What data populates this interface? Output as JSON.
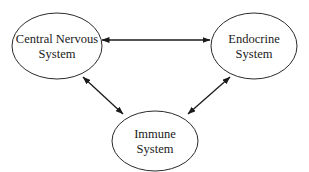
{
  "diagram": {
    "nodes": [
      {
        "id": "cns",
        "label_lines": [
          "Central Nervous",
          "System"
        ]
      },
      {
        "id": "endocrine",
        "label_lines": [
          "Endocrine",
          "System"
        ]
      },
      {
        "id": "immune",
        "label_lines": [
          "Immune",
          "System"
        ]
      }
    ],
    "edges": [
      {
        "from": "cns",
        "to": "endocrine",
        "direction": "bidirectional"
      },
      {
        "from": "cns",
        "to": "immune",
        "direction": "bidirectional"
      },
      {
        "from": "endocrine",
        "to": "immune",
        "direction": "bidirectional"
      }
    ],
    "colors": {
      "stroke": "#1a1a1a",
      "fill": "#ffffff"
    }
  }
}
